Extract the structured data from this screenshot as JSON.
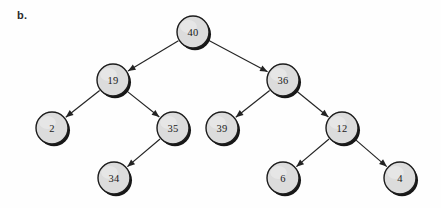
{
  "figure": {
    "part_label": "b.",
    "background_color": "#fefefe",
    "node_fill_color": "#dcdcdc",
    "node_stroke_color": "#1c1c1c",
    "edge_color": "#232323",
    "label_color": "#1a1a1a"
  },
  "chart_data": {
    "type": "diagram",
    "diagram_kind": "binary-tree",
    "title": "",
    "nodes": [
      {
        "id": "n40",
        "label": "40",
        "x": 193,
        "y": 32,
        "r": 16,
        "level": 0
      },
      {
        "id": "n19",
        "label": "19",
        "x": 113,
        "y": 80,
        "r": 16,
        "level": 1
      },
      {
        "id": "n36",
        "label": "36",
        "x": 283,
        "y": 80,
        "r": 16,
        "level": 1
      },
      {
        "id": "n2",
        "label": "2",
        "x": 52,
        "y": 128,
        "r": 16,
        "level": 2
      },
      {
        "id": "n35",
        "label": "35",
        "x": 173,
        "y": 128,
        "r": 16,
        "level": 2
      },
      {
        "id": "n39",
        "label": "39",
        "x": 222,
        "y": 128,
        "r": 16,
        "level": 2
      },
      {
        "id": "n12",
        "label": "12",
        "x": 342,
        "y": 128,
        "r": 16,
        "level": 2
      },
      {
        "id": "n34",
        "label": "34",
        "x": 114,
        "y": 178,
        "r": 16,
        "level": 3
      },
      {
        "id": "n6",
        "label": "6",
        "x": 283,
        "y": 178,
        "r": 16,
        "level": 3
      },
      {
        "id": "n4",
        "label": "4",
        "x": 400,
        "y": 178,
        "r": 16,
        "level": 3
      }
    ],
    "edges": [
      {
        "from": "n40",
        "to": "n19",
        "directed": true
      },
      {
        "from": "n40",
        "to": "n36",
        "directed": true
      },
      {
        "from": "n19",
        "to": "n2",
        "directed": true
      },
      {
        "from": "n19",
        "to": "n35",
        "directed": true
      },
      {
        "from": "n36",
        "to": "n39",
        "directed": true
      },
      {
        "from": "n36",
        "to": "n12",
        "directed": true
      },
      {
        "from": "n35",
        "to": "n34",
        "directed": true
      },
      {
        "from": "n12",
        "to": "n6",
        "directed": true
      },
      {
        "from": "n12",
        "to": "n4",
        "directed": true
      }
    ],
    "root": "n40",
    "values": [
      40,
      19,
      36,
      2,
      35,
      39,
      12,
      34,
      6,
      4
    ]
  }
}
